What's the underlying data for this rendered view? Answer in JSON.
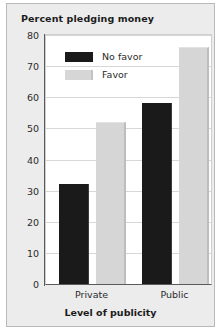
{
  "chart_data": {
    "type": "bar",
    "title": "Percent pledging money",
    "xlabel": "Level of publicity",
    "ylabel": "",
    "categories": [
      "Private",
      "Public"
    ],
    "series": [
      {
        "name": "No favor",
        "values": [
          32,
          58
        ],
        "color": "#1a1a1a"
      },
      {
        "name": "Favor",
        "values": [
          52,
          76
        ],
        "color": "#d6d6d6"
      }
    ],
    "ylim": [
      0,
      80
    ],
    "yticks": [
      0,
      10,
      20,
      30,
      40,
      50,
      60,
      70,
      80
    ],
    "ytick_labels": [
      "0",
      "10",
      "20",
      "30",
      "40",
      "50",
      "60",
      "70",
      "80"
    ],
    "grid": true,
    "legend_position": "top-left-inside"
  },
  "legend": {
    "entries": [
      {
        "label": "No favor",
        "swatch": "dark"
      },
      {
        "label": "Favor",
        "swatch": "light"
      }
    ]
  },
  "colors": {
    "panel_background": "#ececec",
    "panel_border": "#b9b9b9",
    "plot_background": "#ffffff",
    "gridline": "#d7d7d7",
    "axis": "#5a5a5a",
    "text": "#2b2b2b",
    "title_text": "#1c1c1c",
    "bar_no_favor": "#1a1a1a",
    "bar_favor": "#d6d6d6"
  }
}
